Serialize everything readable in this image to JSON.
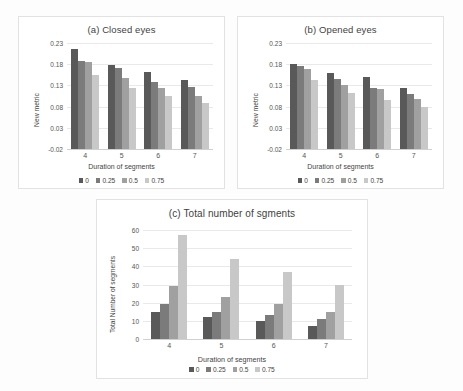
{
  "figure": {
    "background": "#fdfdfd",
    "series_colors": [
      "#595959",
      "#7b7b7b",
      "#a0a0a0",
      "#c8c8c8"
    ]
  },
  "legend": {
    "labels": [
      "0",
      "0.25",
      "0.5",
      "0.75"
    ]
  },
  "panels": [
    {
      "id": "a",
      "title": "(a) Closed eyes"
    },
    {
      "id": "b",
      "title": "(b) Opened eyes"
    },
    {
      "id": "c",
      "title": "(c) Total number of sgments"
    }
  ],
  "chart_data": [
    {
      "type": "bar",
      "title": "(a) Closed eyes",
      "xlabel": "Duration of segments",
      "ylabel": "New metric",
      "categories": [
        "4",
        "5",
        "6",
        "7"
      ],
      "yticks": [
        "0.23",
        "0.18",
        "0.13",
        "0.08",
        "0.03",
        "-0.02"
      ],
      "ylim": [
        -0.02,
        0.23
      ],
      "grid": true,
      "legend_position": "bottom",
      "series": [
        {
          "name": "0",
          "values": [
            0.215,
            0.177,
            0.162,
            0.142
          ]
        },
        {
          "name": "0.25",
          "values": [
            0.187,
            0.17,
            0.137,
            0.126
          ]
        },
        {
          "name": "0.5",
          "values": [
            0.185,
            0.147,
            0.124,
            0.106
          ]
        },
        {
          "name": "0.75",
          "values": [
            0.155,
            0.123,
            0.104,
            0.088
          ]
        }
      ]
    },
    {
      "type": "bar",
      "title": "(b) Opened eyes",
      "xlabel": "Duration of segments",
      "ylabel": "New metric",
      "categories": [
        "4",
        "5",
        "6",
        "7"
      ],
      "yticks": [
        "0.23",
        "0.18",
        "0.13",
        "0.08",
        "0.03",
        "-0.02"
      ],
      "ylim": [
        -0.02,
        0.23
      ],
      "grid": true,
      "legend_position": "bottom",
      "series": [
        {
          "name": "0",
          "values": [
            0.181,
            0.159,
            0.151,
            0.125
          ]
        },
        {
          "name": "0.25",
          "values": [
            0.175,
            0.146,
            0.125,
            0.109
          ]
        },
        {
          "name": "0.5",
          "values": [
            0.169,
            0.131,
            0.121,
            0.098
          ]
        },
        {
          "name": "0.75",
          "values": [
            0.142,
            0.112,
            0.096,
            0.08
          ]
        }
      ]
    },
    {
      "type": "bar",
      "title": "(c) Total number of sgments",
      "xlabel": "Duration of segments",
      "ylabel": "Total Number of segments",
      "categories": [
        "4",
        "5",
        "6",
        "7"
      ],
      "yticks": [
        "60",
        "50",
        "40",
        "30",
        "20",
        "10",
        "0"
      ],
      "ylim": [
        0,
        60
      ],
      "grid": true,
      "legend_position": "bottom",
      "series": [
        {
          "name": "0",
          "values": [
            15,
            12,
            10,
            7
          ]
        },
        {
          "name": "0.25",
          "values": [
            19,
            15,
            13,
            11
          ]
        },
        {
          "name": "0.5",
          "values": [
            29,
            23,
            19,
            15
          ]
        },
        {
          "name": "0.75",
          "values": [
            57,
            44,
            37,
            30
          ]
        }
      ]
    }
  ]
}
